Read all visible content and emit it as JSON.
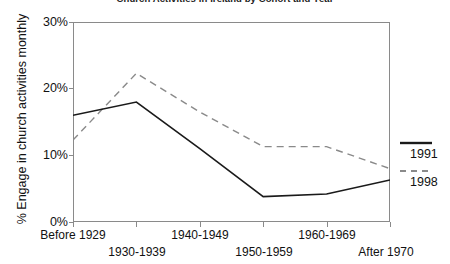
{
  "chart_data": {
    "type": "line",
    "title": "Church Activities in Ireland by Cohort and Year",
    "xlabel": "",
    "ylabel": "% Engage in church activities monthly",
    "categories": [
      "Before 1929",
      "1930-1939",
      "1940-1949",
      "1950-1959",
      "1960-1969",
      "After 1970"
    ],
    "series": [
      {
        "name": "1991",
        "style": "solid",
        "color": "#1a1a1a",
        "values": [
          16.0,
          18.0,
          11.0,
          3.8,
          4.2,
          6.3
        ]
      },
      {
        "name": "1998",
        "style": "dashed",
        "color": "#8a8a8a",
        "values": [
          12.3,
          22.3,
          16.5,
          11.3,
          11.3,
          8.0
        ]
      }
    ],
    "ylim": [
      0,
      30
    ],
    "yticks": [
      0,
      10,
      20,
      30
    ],
    "ytick_labels": [
      "0%",
      "10%",
      "20%",
      "30%"
    ],
    "grid": false,
    "legend_position": "right"
  },
  "legend": {
    "entries": [
      {
        "label": "1991",
        "style": "solid"
      },
      {
        "label": "1998",
        "style": "dashed"
      }
    ]
  },
  "colors": {
    "series_1991": "#1a1a1a",
    "series_1998": "#8a8a8a",
    "axis": "#8a8a8a",
    "text": "#111111",
    "background": "#ffffff"
  }
}
